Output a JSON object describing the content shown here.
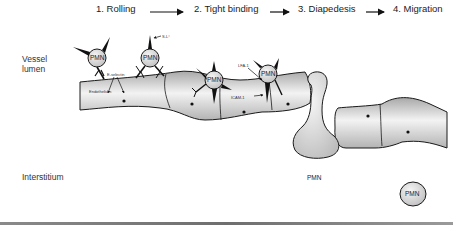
{
  "steps": [
    {
      "number": "1.",
      "label": "Rolling"
    },
    {
      "number": "2.",
      "label": "Tight binding"
    },
    {
      "number": "3.",
      "label": "Diapedesis"
    },
    {
      "number": "4.",
      "label": "Migration"
    }
  ],
  "steps_text": {
    "s1": "1.  Rolling",
    "s2": "2.  Tight binding",
    "s3": "3.  Diapedesis",
    "s4": "4.  Migration"
  },
  "regions": {
    "vessel_lumen_line1": "Vessel",
    "vessel_lumen_line2": "lumen",
    "interstitium": "Interstitium"
  },
  "labels": {
    "endothelium": "Endothelium",
    "e_selectin": "E-selectin",
    "s_l": "S-L°",
    "lfa1": "LFA-1",
    "icam1": "ICAM-1"
  },
  "cells": {
    "pmn1": "PMN",
    "pmn2": "PMN",
    "pmn3": "PMN",
    "pmn4": "PMN",
    "pmn5": "PMN",
    "pmn6": "PMN"
  },
  "colors": {
    "outline": "#1a1a1a",
    "cell_fill_light": "#f4f4f4",
    "cell_fill_dark": "#bdbdbd",
    "endothelium_light": "#f2f2f2",
    "endothelium_dark": "#a9a9a9"
  }
}
